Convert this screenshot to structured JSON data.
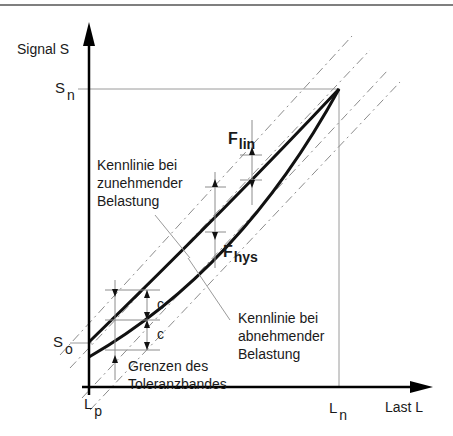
{
  "diagram": {
    "axes": {
      "y_label": "Signal S",
      "x_label": "Last L",
      "y_ticks": [
        {
          "main": "S",
          "sub": "n"
        },
        {
          "main": "S",
          "sub": "o"
        }
      ],
      "x_ticks": [
        {
          "main": "L",
          "sub": "p"
        },
        {
          "main": "L",
          "sub": "n"
        }
      ]
    },
    "annotations": {
      "f_lin": {
        "main": "F",
        "sub": "lin"
      },
      "f_hys": {
        "main": "F",
        "sub": "hys"
      },
      "c_upper": "c",
      "c_lower": "c",
      "increasing_curve": "Kennlinie bei\nzunehmender\nBelastung",
      "decreasing_curve": "Kennlinie bei\nabnehmender\nBelastung",
      "tolerance_band": "Grenzen des\nToleranzbandes"
    },
    "colors": {
      "curve": "#111111",
      "guide": "#9a9a9a",
      "band": "#8c8c8c",
      "axis": "#000000"
    }
  }
}
